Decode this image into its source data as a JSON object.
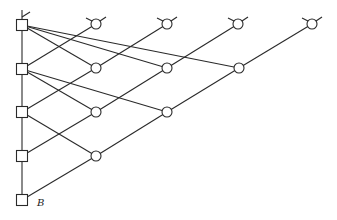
{
  "diagram": {
    "type": "triangular lattice network",
    "label": "B",
    "colors": {
      "stroke": "#2a2a2a",
      "background": "#ffffff"
    },
    "squares": [
      {
        "id": "S0",
        "x": 22,
        "y": 25
      },
      {
        "id": "S1",
        "x": 22,
        "y": 69
      },
      {
        "id": "S2",
        "x": 22,
        "y": 112
      },
      {
        "id": "S3",
        "x": 22,
        "y": 156
      },
      {
        "id": "S4",
        "x": 22,
        "y": 200
      }
    ],
    "circles": [
      {
        "id": "C03",
        "x": 96,
        "y": 24,
        "top": true
      },
      {
        "id": "C02",
        "x": 167,
        "y": 24,
        "top": true
      },
      {
        "id": "C01",
        "x": 238,
        "y": 24,
        "top": true
      },
      {
        "id": "C00",
        "x": 312,
        "y": 24,
        "top": true
      },
      {
        "id": "C13",
        "x": 96,
        "y": 68
      },
      {
        "id": "C12",
        "x": 167,
        "y": 68
      },
      {
        "id": "C11",
        "x": 239,
        "y": 68
      },
      {
        "id": "C23",
        "x": 96,
        "y": 112
      },
      {
        "id": "C22",
        "x": 167,
        "y": 112
      },
      {
        "id": "C33",
        "x": 96,
        "y": 156
      }
    ],
    "edges": [
      [
        "S1",
        "C03"
      ],
      [
        "S2",
        "C13"
      ],
      [
        "C13",
        "C02"
      ],
      [
        "S3",
        "C23"
      ],
      [
        "C23",
        "C12"
      ],
      [
        "C12",
        "C01"
      ],
      [
        "S4",
        "C33"
      ],
      [
        "C33",
        "C22"
      ],
      [
        "C22",
        "C11"
      ],
      [
        "C11",
        "C00"
      ],
      [
        "S0",
        "C13"
      ],
      [
        "S0",
        "C12"
      ],
      [
        "S0",
        "C11"
      ],
      [
        "S1",
        "C23"
      ],
      [
        "S1",
        "C22"
      ],
      [
        "S2",
        "C33"
      ],
      [
        "S0",
        "S4"
      ]
    ]
  }
}
